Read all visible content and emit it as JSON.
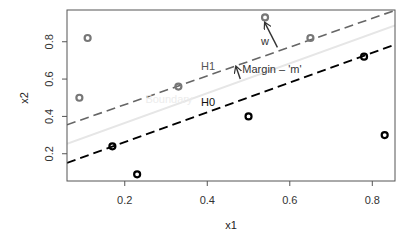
{
  "chart_data": {
    "type": "scatter",
    "title": "",
    "xlabel": "x1",
    "ylabel": "x2",
    "xlim": [
      0.06,
      0.855
    ],
    "ylim": [
      0.054,
      0.97
    ],
    "grid": false,
    "legend": null,
    "x_ticks": [
      0.2,
      0.4,
      0.6,
      0.8
    ],
    "x_tick_labels": [
      "0.2",
      "0.4",
      "0.6",
      "0.8"
    ],
    "y_ticks": [
      0.2,
      0.4,
      0.6,
      0.8
    ],
    "y_tick_labels": [
      "0.2",
      "0.4",
      "0.6",
      "0.8"
    ],
    "series": [
      {
        "name": "class-gray",
        "color": "#777777",
        "marker": "open-circle",
        "points": [
          {
            "x": 0.09,
            "y": 0.5
          },
          {
            "x": 0.11,
            "y": 0.82
          },
          {
            "x": 0.33,
            "y": 0.56
          },
          {
            "x": 0.54,
            "y": 0.93
          },
          {
            "x": 0.65,
            "y": 0.82
          }
        ]
      },
      {
        "name": "class-black",
        "color": "#000000",
        "marker": "open-circle",
        "points": [
          {
            "x": 0.17,
            "y": 0.24
          },
          {
            "x": 0.23,
            "y": 0.09
          },
          {
            "x": 0.5,
            "y": 0.4
          },
          {
            "x": 0.78,
            "y": 0.72
          },
          {
            "x": 0.83,
            "y": 0.3
          }
        ]
      }
    ],
    "lines": [
      {
        "name": "H1",
        "label": "H1",
        "color": "#666666",
        "style": "dashed",
        "width": 1.6,
        "from": [
          0.06,
          0.355
        ],
        "to": [
          0.855,
          0.968
        ],
        "label_at": [
          0.385,
          0.65
        ]
      },
      {
        "name": "Boundary",
        "label": "Boundary",
        "color": "#e6e6e6",
        "style": "solid",
        "width": 2,
        "from": [
          0.06,
          0.253
        ],
        "to": [
          0.855,
          0.887
        ],
        "label_at": [
          0.25,
          0.47
        ]
      },
      {
        "name": "H0",
        "label": "H0",
        "color": "#000000",
        "style": "dashed",
        "width": 1.8,
        "from": [
          0.06,
          0.151
        ],
        "to": [
          0.855,
          0.785
        ],
        "label_at": [
          0.385,
          0.455
        ]
      }
    ],
    "annotations": [
      {
        "name": "w",
        "text": "w",
        "color": "#333333",
        "arrow_from": [
          0.57,
          0.77
        ],
        "arrow_to": [
          0.54,
          0.9
        ],
        "text_at": [
          0.53,
          0.78
        ]
      },
      {
        "name": "margin",
        "text": "Margin – 'm'",
        "color": "#333333",
        "arrow_from": [
          0.48,
          0.6
        ],
        "arrow_to": [
          0.47,
          0.665
        ],
        "text_at": [
          0.485,
          0.63
        ]
      }
    ]
  }
}
